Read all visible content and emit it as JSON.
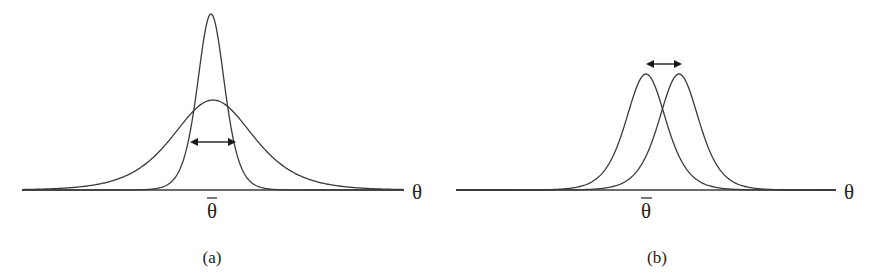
{
  "figure": {
    "panels": [
      {
        "id": "a",
        "caption": "(a)",
        "axis_label": "θ",
        "mean_label": "θ",
        "axis": {
          "x1": 22,
          "x2": 404,
          "y": 190
        },
        "axis_label_pos": {
          "x": 412,
          "y": 199
        },
        "mean_label_pos": {
          "x": 212,
          "y": 218
        },
        "mean_bar": {
          "x1": 207,
          "x2": 217,
          "y": 198
        },
        "caption_pos": {
          "x": 212,
          "y": 263
        },
        "curves": [
          {
            "name": "narrow-tall-distribution",
            "center": 211,
            "peak_y": 14,
            "width": 22,
            "shape": 2.2,
            "x_min": 22,
            "x_max": 404
          },
          {
            "name": "wide-short-distribution",
            "center": 213,
            "peak_y": 100,
            "width": 55,
            "shape": 1.6,
            "x_min": 22,
            "x_max": 404
          }
        ],
        "arrow": {
          "x1": 190,
          "x2": 236,
          "y": 142,
          "meaning": "spread-width"
        }
      },
      {
        "id": "b",
        "caption": "(b)",
        "axis_label": "θ",
        "mean_label": "θ",
        "axis": {
          "x1": 456,
          "x2": 836,
          "y": 190
        },
        "axis_label_pos": {
          "x": 844,
          "y": 199
        },
        "mean_label_pos": {
          "x": 646,
          "y": 218
        },
        "mean_bar": {
          "x1": 641,
          "x2": 652,
          "y": 198
        },
        "caption_pos": {
          "x": 657,
          "y": 263
        },
        "curves": [
          {
            "name": "left-shifted-distribution",
            "center": 646,
            "peak_y": 74,
            "width": 30,
            "shape": 1.9,
            "x_min": 456,
            "x_max": 836
          },
          {
            "name": "right-shifted-distribution",
            "center": 679,
            "peak_y": 74,
            "width": 30,
            "shape": 1.9,
            "x_min": 456,
            "x_max": 836
          }
        ],
        "arrow": {
          "x1": 646,
          "x2": 682,
          "y": 64,
          "meaning": "mean-shift"
        }
      }
    ]
  }
}
